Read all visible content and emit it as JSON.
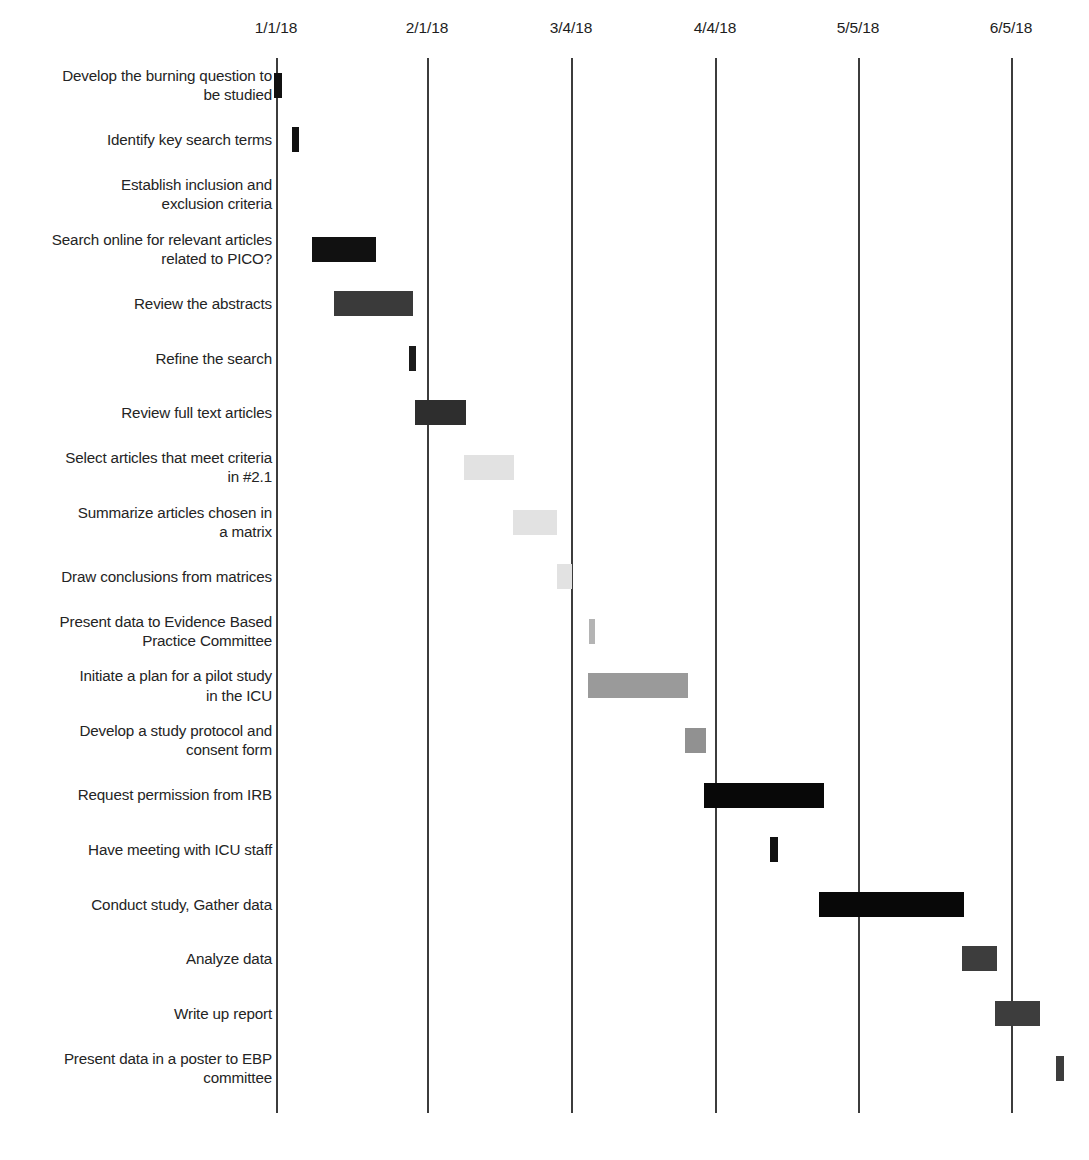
{
  "chart_data": {
    "type": "bar",
    "orientation": "horizontal",
    "subtype": "gantt",
    "title": "",
    "xlabel": "",
    "ylabel": "",
    "grid": true,
    "legend": "none",
    "axis_ticks": [
      "1/1/18",
      "2/1/18",
      "3/4/18",
      "4/4/18",
      "5/5/18",
      "6/5/18"
    ],
    "axis_tick_x": [
      276,
      427,
      571,
      715,
      858,
      1011
    ],
    "x_axis_start_date": "1/1/18",
    "x_axis_end_date": "6/5/18",
    "categories": [
      "Develop the burning question to be studied",
      "Identify key search terms",
      "Establish inclusion and exclusion criteria",
      "Search online for relevant articles related to PICO?",
      "Review the abstracts",
      "Refine the search",
      "Review full text articles",
      "Select articles that meet criteria in #2.1",
      "Summarize articles chosen in a matrix",
      "Draw conclusions from matrices",
      "Present data to Evidence Based Practice Committee",
      "Initiate a plan for a pilot study in the ICU",
      "Develop a study protocol and consent form",
      "Request permission from IRB",
      "Have meeting with ICU staff",
      "Conduct study, Gather data",
      "Analyze data",
      "Write up report",
      "Present data in a poster to EBP committee"
    ],
    "tasks": [
      {
        "label_line1": "Develop the burning question to",
        "label_line2": "be studied",
        "start_x": 274,
        "end_x": 282,
        "color": "#111111",
        "has_bar": true
      },
      {
        "label_line1": "Identify key search terms",
        "label_line2": "",
        "start_x": 292,
        "end_x": 299,
        "color": "#111111",
        "has_bar": true
      },
      {
        "label_line1": "Establish inclusion and",
        "label_line2": "exclusion criteria",
        "start_x": 0,
        "end_x": 0,
        "color": "#111111",
        "has_bar": false
      },
      {
        "label_line1": "Search online for relevant articles",
        "label_line2": "related to PICO?",
        "start_x": 312,
        "end_x": 376,
        "color": "#111111",
        "has_bar": true
      },
      {
        "label_line1": "Review the abstracts",
        "label_line2": "",
        "start_x": 334,
        "end_x": 413,
        "color": "#3a3a3a",
        "has_bar": true
      },
      {
        "label_line1": "Refine the search",
        "label_line2": "",
        "start_x": 409,
        "end_x": 416,
        "color": "#1b1b1b",
        "has_bar": true
      },
      {
        "label_line1": "Review full text articles",
        "label_line2": "",
        "start_x": 415,
        "end_x": 466,
        "color": "#2e2e2e",
        "has_bar": true
      },
      {
        "label_line1": "Select articles that meet criteria",
        "label_line2": "in #2.1",
        "start_x": 464,
        "end_x": 514,
        "color": "#e2e2e2",
        "has_bar": true
      },
      {
        "label_line1": "Summarize articles chosen in",
        "label_line2": "a matrix",
        "start_x": 513,
        "end_x": 557,
        "color": "#e2e2e2",
        "has_bar": true
      },
      {
        "label_line1": "Draw conclusions from matrices",
        "label_line2": "",
        "start_x": 557,
        "end_x": 572,
        "color": "#e2e2e2",
        "has_bar": true
      },
      {
        "label_line1": "Present data to Evidence Based",
        "label_line2": "Practice Committee",
        "start_x": 589,
        "end_x": 595,
        "color": "#b4b4b4",
        "has_bar": true
      },
      {
        "label_line1": "Initiate a plan for a pilot study",
        "label_line2": "in the ICU",
        "start_x": 588,
        "end_x": 688,
        "color": "#9a9a9a",
        "has_bar": true
      },
      {
        "label_line1": "Develop a study protocol and",
        "label_line2": "consent form",
        "start_x": 685,
        "end_x": 706,
        "color": "#919191",
        "has_bar": true
      },
      {
        "label_line1": "Request permission from IRB",
        "label_line2": "",
        "start_x": 704,
        "end_x": 824,
        "color": "#080808",
        "has_bar": true
      },
      {
        "label_line1": "Have meeting with ICU staff",
        "label_line2": "",
        "start_x": 770,
        "end_x": 778,
        "color": "#111111",
        "has_bar": true
      },
      {
        "label_line1": "Conduct study, Gather data",
        "label_line2": "",
        "start_x": 819,
        "end_x": 964,
        "color": "#080808",
        "has_bar": true
      },
      {
        "label_line1": "Analyze data",
        "label_line2": "",
        "start_x": 962,
        "end_x": 997,
        "color": "#3d3d3d",
        "has_bar": true
      },
      {
        "label_line1": "Write up report",
        "label_line2": "",
        "start_x": 995,
        "end_x": 1040,
        "color": "#3d3d3d",
        "has_bar": true
      },
      {
        "label_line1": "Present data in a poster to EBP",
        "label_line2": "committee",
        "start_x": 1056,
        "end_x": 1064,
        "color": "#3d3d3d",
        "has_bar": true
      }
    ]
  },
  "style": {
    "background": "#ffffff",
    "gridline_color": "#3c3c3c",
    "text_color": "#242424",
    "axis_label_color": "#1d1d1d"
  }
}
